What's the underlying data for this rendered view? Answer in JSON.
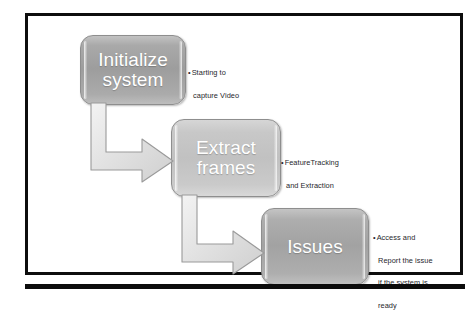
{
  "diagram": {
    "background_color": "#ffffff",
    "frame_border_color": "#0d0d0d",
    "bottom_rule_color": "#0c0c0c",
    "node_text_color": "#ffffff",
    "annotation_text_color": "#26262b",
    "arrow_fill_color": "#e3e3e3",
    "arrow_stroke_color": "#9a9a9a",
    "nodes": [
      {
        "id": "initialize",
        "label": "Initialize system",
        "line1": "Initialize",
        "line2": "system",
        "fill_color": "#9d9d9d"
      },
      {
        "id": "extract",
        "label": "Extract frames",
        "line1": "Extract",
        "line2": "frames",
        "fill_color": "#c1c1c1"
      },
      {
        "id": "issues",
        "label": "Issues",
        "line1": "Issues",
        "line2": "",
        "fill_color": "#a2a2a2"
      }
    ],
    "annotations": [
      {
        "id": "initialize-note",
        "for_node": "initialize",
        "lines": [
          "Starting to",
          "capture Video"
        ]
      },
      {
        "id": "extract-note",
        "for_node": "extract",
        "lines": [
          "FeatureTracking",
          "and  Extraction"
        ]
      },
      {
        "id": "issues-note",
        "for_node": "issues",
        "lines": [
          "Access and",
          "Report the issue",
          "if the system is",
          "ready"
        ]
      }
    ],
    "connectors": [
      {
        "id": "arrow-initialize-to-extract",
        "from": "initialize",
        "to": "extract",
        "shape": "elbow-down-right"
      },
      {
        "id": "arrow-extract-to-issues",
        "from": "extract",
        "to": "issues",
        "shape": "elbow-down-right"
      }
    ]
  }
}
